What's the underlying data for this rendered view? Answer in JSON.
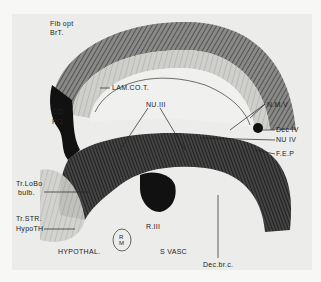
{
  "figure": {
    "labels": [
      {
        "id": "fib-opt",
        "text": "Fib opt",
        "x": 50,
        "y": 22
      },
      {
        "id": "brt",
        "text": "BrT.",
        "x": 50,
        "y": 31
      },
      {
        "id": "lam-co-t",
        "text": "LAM.CO.T.",
        "x": 112,
        "y": 85
      },
      {
        "id": "nu-iii",
        "text": "NU.III",
        "x": 146,
        "y": 103
      },
      {
        "id": "co",
        "text": "CO.",
        "x": 52,
        "y": 109
      },
      {
        "id": "po",
        "text": "PO.",
        "x": 52,
        "y": 119
      },
      {
        "id": "n-m-v",
        "text": "N.M.V",
        "x": 267,
        "y": 102
      },
      {
        "id": "dec-iv",
        "text": "Dec IV",
        "x": 276,
        "y": 127
      },
      {
        "id": "nu-iv",
        "text": "NU IV",
        "x": 276,
        "y": 137
      },
      {
        "id": "f-e-p",
        "text": "F.E.P",
        "x": 276,
        "y": 151
      },
      {
        "id": "tr-lobo",
        "text": "Tr.LoBo",
        "x": 16,
        "y": 182
      },
      {
        "id": "bulb",
        "text": "bulb.",
        "x": 18,
        "y": 191
      },
      {
        "id": "tr-str",
        "text": "Tr.STR.",
        "x": 16,
        "y": 216
      },
      {
        "id": "hypoth",
        "text": "HypoTH",
        "x": 16,
        "y": 226
      },
      {
        "id": "r-iii",
        "text": "R.III",
        "x": 146,
        "y": 224
      },
      {
        "id": "r-m",
        "text": "R\nM",
        "x": 121,
        "y": 236
      },
      {
        "id": "hypothal",
        "text": "HYPOTHAL.",
        "x": 58,
        "y": 249
      },
      {
        "id": "s-vasc",
        "text": "S VASC",
        "x": 160,
        "y": 249
      },
      {
        "id": "dec-br-c",
        "text": "Dec.br.c.",
        "x": 203,
        "y": 262
      }
    ]
  }
}
